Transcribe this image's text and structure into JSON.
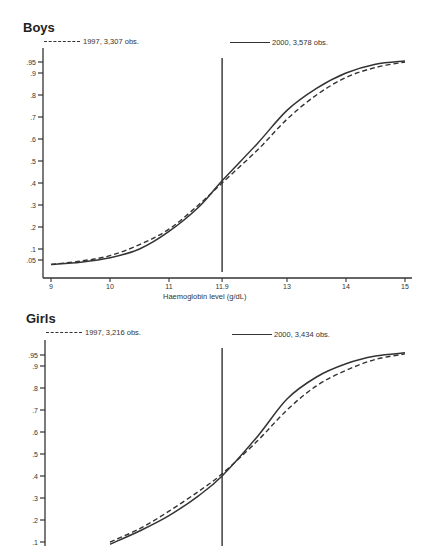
{
  "panels": [
    {
      "title": "Boys",
      "legend": {
        "dashed": "1997, 3,307 obs.",
        "solid": "2000, 3,578 obs."
      },
      "xlabel": "Haemoglobin level (g/dL)"
    },
    {
      "title": "Girls",
      "legend": {
        "dashed": "1997, 3,216 obs.",
        "solid": "2000, 3,434 obs."
      },
      "xlabel": ""
    }
  ],
  "chart_data": [
    {
      "type": "line",
      "title": "Boys",
      "xlabel": "Haemoglobin level (g/dL)",
      "ylabel": "",
      "x_ticks": [
        "9",
        "10",
        "11",
        "11.9",
        "13",
        "14",
        "15"
      ],
      "y_ticks": [
        ".05",
        ".1",
        ".2",
        ".3",
        ".4",
        ".5",
        ".6",
        ".7",
        ".8",
        ".9",
        ".95"
      ],
      "xlim": [
        9,
        15
      ],
      "ylim": [
        0.0,
        0.97
      ],
      "vertical_line": 11.9,
      "x": [
        9,
        9.5,
        10,
        10.5,
        11,
        11.5,
        11.9,
        12.5,
        13,
        13.5,
        14,
        14.5,
        15
      ],
      "series": [
        {
          "name": "1997, 3,307 obs.",
          "style": "dashed",
          "values": [
            0.03,
            0.045,
            0.07,
            0.12,
            0.19,
            0.3,
            0.4,
            0.55,
            0.69,
            0.8,
            0.88,
            0.925,
            0.95
          ]
        },
        {
          "name": "2000, 3,578 obs.",
          "style": "solid",
          "values": [
            0.03,
            0.04,
            0.06,
            0.1,
            0.18,
            0.29,
            0.41,
            0.58,
            0.73,
            0.83,
            0.9,
            0.94,
            0.955
          ]
        }
      ],
      "grid": false,
      "legend_position": "top"
    },
    {
      "type": "line",
      "title": "Girls",
      "xlabel": "",
      "ylabel": "",
      "x_ticks": [],
      "y_ticks": [
        ".1",
        ".2",
        ".3",
        ".4",
        ".5",
        ".6",
        ".7",
        ".8",
        ".9",
        ".95"
      ],
      "xlim": [
        9,
        15
      ],
      "ylim": [
        0.1,
        0.97
      ],
      "vertical_line": 11.9,
      "x": [
        10,
        10.5,
        11,
        11.5,
        11.9,
        12.5,
        13,
        13.5,
        14,
        14.5,
        15
      ],
      "series": [
        {
          "name": "1997, 3,216 obs.",
          "style": "dashed",
          "values": [
            0.1,
            0.16,
            0.24,
            0.33,
            0.41,
            0.56,
            0.7,
            0.81,
            0.88,
            0.93,
            0.955
          ]
        },
        {
          "name": "2000, 3,434 obs.",
          "style": "solid",
          "values": [
            0.09,
            0.15,
            0.22,
            0.31,
            0.4,
            0.58,
            0.75,
            0.85,
            0.91,
            0.945,
            0.96
          ]
        }
      ],
      "grid": false,
      "legend_position": "top"
    }
  ]
}
